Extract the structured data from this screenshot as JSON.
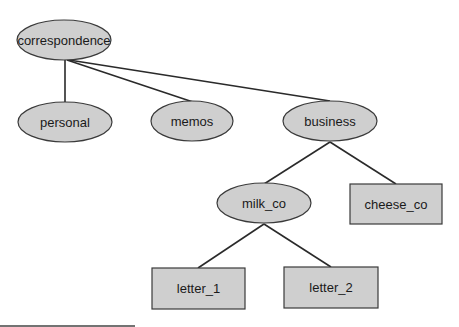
{
  "diagram": {
    "type": "tree",
    "nodes": [
      {
        "id": "correspondence",
        "label": "correspondence",
        "shape": "ellipse",
        "cx": 64,
        "cy": 40,
        "rx": 47,
        "ry": 20
      },
      {
        "id": "personal",
        "label": "personal",
        "shape": "ellipse",
        "cx": 65,
        "cy": 122,
        "rx": 47,
        "ry": 20
      },
      {
        "id": "memos",
        "label": "memos",
        "shape": "ellipse",
        "cx": 192,
        "cy": 121,
        "rx": 41,
        "ry": 20
      },
      {
        "id": "business",
        "label": "business",
        "shape": "ellipse",
        "cx": 330,
        "cy": 121,
        "rx": 47,
        "ry": 20
      },
      {
        "id": "milk_co",
        "label": "milk_co",
        "shape": "ellipse",
        "cx": 264,
        "cy": 203,
        "rx": 47,
        "ry": 20
      },
      {
        "id": "cheese_co",
        "label": "cheese_co",
        "shape": "rect",
        "x": 350,
        "y": 184,
        "w": 92,
        "h": 40
      },
      {
        "id": "letter_1",
        "label": "letter_1",
        "shape": "rect",
        "x": 152,
        "y": 268,
        "w": 93,
        "h": 41
      },
      {
        "id": "letter_2",
        "label": "letter_2",
        "shape": "rect",
        "x": 284,
        "y": 267,
        "w": 94,
        "h": 41
      }
    ],
    "edges": [
      {
        "from": "correspondence",
        "to": "personal",
        "x1": 65,
        "y1": 60,
        "x2": 65,
        "y2": 102
      },
      {
        "from": "correspondence",
        "to": "memos",
        "x1": 67,
        "y1": 60,
        "x2": 193,
        "y2": 102
      },
      {
        "from": "correspondence",
        "to": "business",
        "x1": 69,
        "y1": 60,
        "x2": 330,
        "y2": 101
      },
      {
        "from": "business",
        "to": "milk_co",
        "x1": 330,
        "y1": 142,
        "x2": 264,
        "y2": 184
      },
      {
        "from": "business",
        "to": "cheese_co",
        "x1": 330,
        "y1": 142,
        "x2": 396,
        "y2": 184
      },
      {
        "from": "milk_co",
        "to": "letter_1",
        "x1": 264,
        "y1": 224,
        "x2": 198,
        "y2": 268
      },
      {
        "from": "milk_co",
        "to": "letter_2",
        "x1": 264,
        "y1": 224,
        "x2": 331,
        "y2": 267
      }
    ],
    "colors": {
      "node_fill": "#cfcfcf",
      "stroke": "#3a3a3a",
      "edge": "#2a2a2a"
    }
  }
}
